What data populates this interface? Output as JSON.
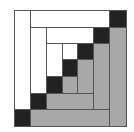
{
  "diagram": {
    "type": "log-cabin-quilt-block",
    "colors": {
      "dark": "#222222",
      "light": "#ffffff",
      "medium": "#a8a8a8",
      "line": "#555555"
    },
    "col_edges": [
      0,
      16,
      32,
      48,
      63,
      79,
      95,
      112
    ],
    "row_edges": [
      0,
      17,
      33,
      49,
      66,
      83,
      99,
      116
    ],
    "blocks": [
      {
        "c0": 0,
        "c1": 1,
        "r0": 0,
        "r1": 6,
        "tone": "light"
      },
      {
        "c0": 1,
        "c1": 6,
        "r0": 0,
        "r1": 1,
        "tone": "light"
      },
      {
        "c0": 6,
        "c1": 7,
        "r0": 0,
        "r1": 1,
        "tone": "dark"
      },
      {
        "c0": 1,
        "c1": 2,
        "r0": 1,
        "r1": 5,
        "tone": "light"
      },
      {
        "c0": 2,
        "c1": 5,
        "r0": 1,
        "r1": 2,
        "tone": "light"
      },
      {
        "c0": 5,
        "c1": 6,
        "r0": 1,
        "r1": 2,
        "tone": "dark"
      },
      {
        "c0": 2,
        "c1": 3,
        "r0": 2,
        "r1": 4,
        "tone": "light"
      },
      {
        "c0": 3,
        "c1": 4,
        "r0": 2,
        "r1": 3,
        "tone": "light"
      },
      {
        "c0": 4,
        "c1": 5,
        "r0": 2,
        "r1": 3,
        "tone": "dark"
      },
      {
        "c0": 3,
        "c1": 4,
        "r0": 3,
        "r1": 4,
        "tone": "dark"
      },
      {
        "c0": 2,
        "c1": 3,
        "r0": 4,
        "r1": 5,
        "tone": "dark"
      },
      {
        "c0": 1,
        "c1": 2,
        "r0": 5,
        "r1": 6,
        "tone": "dark"
      },
      {
        "c0": 0,
        "c1": 1,
        "r0": 6,
        "r1": 7,
        "tone": "dark"
      },
      {
        "c0": 3,
        "c1": 4,
        "r0": 4,
        "r1": 5,
        "tone": "medium"
      },
      {
        "c0": 4,
        "c1": 5,
        "r0": 3,
        "r1": 5,
        "tone": "medium"
      },
      {
        "c0": 2,
        "c1": 5,
        "r0": 5,
        "r1": 6,
        "tone": "medium"
      },
      {
        "c0": 5,
        "c1": 6,
        "r0": 2,
        "r1": 6,
        "tone": "medium"
      },
      {
        "c0": 1,
        "c1": 6,
        "r0": 6,
        "r1": 7,
        "tone": "medium"
      },
      {
        "c0": 6,
        "c1": 7,
        "r0": 1,
        "r1": 7,
        "tone": "medium"
      }
    ]
  }
}
